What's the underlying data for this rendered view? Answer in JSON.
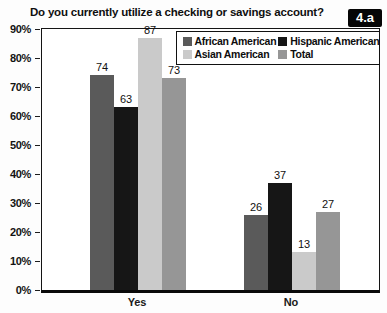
{
  "clipped_header": "OF FINANCIAL SERVICES",
  "figure_label": "4.a",
  "chart_data": {
    "type": "bar",
    "title": "Do you currently utilize a checking or savings account?",
    "categories": [
      "Yes",
      "No"
    ],
    "series": [
      {
        "name": "African American",
        "color": "#5a5a5a",
        "values": [
          74,
          26
        ]
      },
      {
        "name": "Hispanic American",
        "color": "#161616",
        "values": [
          63,
          37
        ]
      },
      {
        "name": "Asian American",
        "color": "#cacaca",
        "values": [
          87,
          13
        ]
      },
      {
        "name": "Total",
        "color": "#969696",
        "values": [
          73,
          27
        ]
      }
    ],
    "ylabel": "",
    "ylim": [
      0,
      90
    ],
    "y_ticks": [
      "90%",
      "80%",
      "70%",
      "60%",
      "50%",
      "40%",
      "30%",
      "20%",
      "10%",
      "0%"
    ],
    "grid": false,
    "legend_position": "top-right-inside",
    "value_labels": true
  },
  "colors": {
    "badge_bg": "#060606",
    "badge_text": "#ffffff",
    "plot_border": "#141414",
    "axis": "#0a0a0a",
    "background": "#ffffff"
  }
}
